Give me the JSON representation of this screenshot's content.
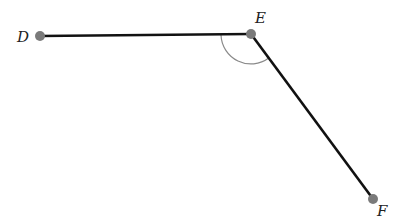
{
  "diagram": {
    "type": "angle",
    "points": {
      "D": {
        "label": "D",
        "x": 40,
        "y": 36
      },
      "E": {
        "label": "E",
        "x": 251,
        "y": 34
      },
      "F": {
        "label": "F",
        "x": 373,
        "y": 199
      }
    },
    "segments": [
      "DE",
      "EF"
    ],
    "angle_marked": "DEF",
    "colors": {
      "line": "#111111",
      "point": "#7a7a7a",
      "arc": "#8a8a8a"
    }
  }
}
